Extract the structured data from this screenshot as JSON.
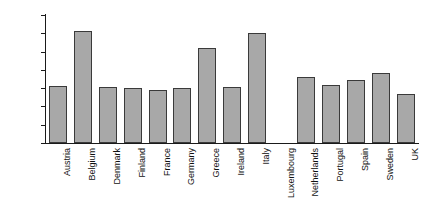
{
  "chart_data": {
    "type": "bar",
    "title": "",
    "xlabel": "",
    "ylabel": "",
    "ylim": [
      0,
      140
    ],
    "yticks": [
      0,
      20,
      40,
      60,
      80,
      100,
      120,
      140
    ],
    "grid": false,
    "legend": null,
    "bar_color": "#a8a8a8",
    "bar_edge_color": "#3a3a3a",
    "categories": [
      "Austria",
      "Belgium",
      "Denmark",
      "Finland",
      "France",
      "Germany",
      "Greece",
      "Ireland",
      "Italy",
      "Luxembourg",
      "Netherlands",
      "Portugal",
      "Spain",
      "Sweden",
      "UK"
    ],
    "values": [
      62,
      122,
      61,
      60,
      58,
      60,
      104,
      61,
      120,
      0,
      72,
      63,
      69,
      77,
      54
    ]
  }
}
